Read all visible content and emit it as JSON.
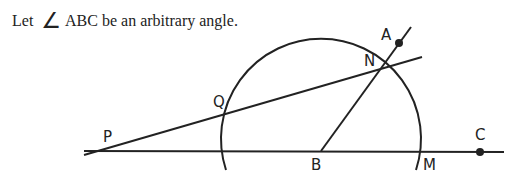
{
  "caption": {
    "prefix": "Let",
    "angle_symbol": "∠",
    "text": "ABC be an arbitrary angle."
  },
  "figure": {
    "labels": {
      "A": "A",
      "N": "N",
      "Q": "Q",
      "P": "P",
      "B": "B",
      "M": "M",
      "C": "C"
    },
    "stroke_color": "#222222"
  }
}
